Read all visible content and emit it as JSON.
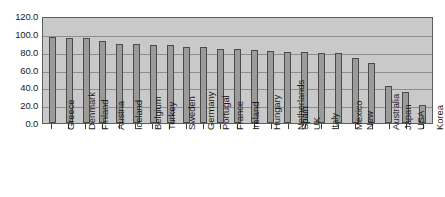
{
  "chart_data": {
    "type": "bar",
    "title": "",
    "subtitle": "",
    "xlabel": "",
    "ylabel": "",
    "ylim": [
      0.0,
      120.0
    ],
    "ytick_step": 20.0,
    "grid": true,
    "legend": "none",
    "categories": [
      "Greece",
      "Denmark",
      "Finland",
      "Austria",
      "Iceland",
      "Belgium",
      "Turkey",
      "Sweden",
      "Germany",
      "Portugal",
      "France",
      "Ireland",
      "Hungary",
      "Netherlands",
      "Spain",
      "UK",
      "Italy",
      "Mexico",
      "New",
      "Australia",
      "Japan",
      "USA",
      "Korea"
    ],
    "values": [
      97.0,
      95.0,
      95.0,
      92.0,
      89.0,
      89.0,
      88.0,
      87.0,
      85.0,
      85.0,
      83.0,
      83.0,
      82.0,
      81.0,
      80.0,
      80.0,
      78.0,
      78.0,
      73.0,
      67.0,
      42.0,
      35.0,
      20.0
    ],
    "ytick_labels": [
      "120.0",
      "100.0",
      "80.0",
      "60.0",
      "40.0",
      "20.0",
      "0.0"
    ],
    "ytick_values": [
      120.0,
      100.0,
      80.0,
      60.0,
      40.0,
      20.0,
      0.0
    ],
    "colors": {
      "bar_fill": "#9b9b9b",
      "bar_border": "#4a4a4a",
      "plot_background": "#c9c9c9",
      "gridline": "#8d8d8d",
      "axis": "#5e5e5e",
      "text": "#1a1a1a",
      "page_background": "#ffffff"
    }
  }
}
